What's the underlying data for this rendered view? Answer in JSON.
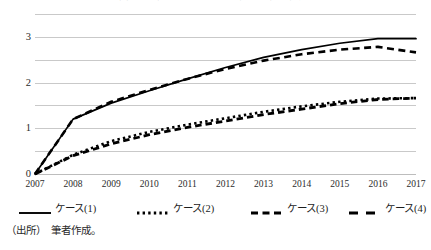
{
  "chart_data": {
    "type": "line",
    "title": "図表 1　各ケースにおける推計結果の推移",
    "xlabel": "",
    "ylabel": "",
    "x": [
      2007,
      2008,
      2009,
      2010,
      2011,
      2012,
      2013,
      2014,
      2015,
      2016,
      2017
    ],
    "categories": [
      "2007",
      "2008",
      "2009",
      "2010",
      "2011",
      "2012",
      "2013",
      "2014",
      "2015",
      "2016",
      "2017"
    ],
    "xlim": [
      2007,
      2017
    ],
    "ylim": [
      0,
      3.5
    ],
    "yticks": [
      0,
      1,
      2,
      3
    ],
    "ytick_labels": [
      "0",
      "1",
      "2",
      "3"
    ],
    "gridlines": [
      0,
      0.5,
      1,
      1.5,
      2,
      2.5,
      3,
      3.5
    ],
    "grid": true,
    "legend_position": "bottom",
    "series": [
      {
        "name": "ケース(1)",
        "style": "solid",
        "values": [
          0.0,
          1.2,
          1.55,
          1.82,
          2.08,
          2.33,
          2.55,
          2.72,
          2.86,
          2.96,
          2.96
        ]
      },
      {
        "name": "ケース(2)",
        "style": "dotted",
        "values": [
          0.0,
          0.42,
          0.72,
          0.92,
          1.08,
          1.22,
          1.36,
          1.48,
          1.58,
          1.65,
          1.66
        ]
      },
      {
        "name": "ケース(3)",
        "style": "dashed-short",
        "values": [
          0.0,
          1.2,
          1.58,
          1.84,
          2.08,
          2.3,
          2.48,
          2.62,
          2.72,
          2.78,
          2.66
        ]
      },
      {
        "name": "ケース(4)",
        "style": "dashed-long",
        "values": [
          0.0,
          0.4,
          0.66,
          0.86,
          1.02,
          1.16,
          1.3,
          1.42,
          1.54,
          1.63,
          1.66
        ]
      }
    ]
  },
  "source": {
    "label": "（出所）",
    "text": "筆者作成。"
  },
  "colors": {
    "line": "#000000",
    "grid": "#c9c9c9",
    "text": "#1d1d1d"
  }
}
